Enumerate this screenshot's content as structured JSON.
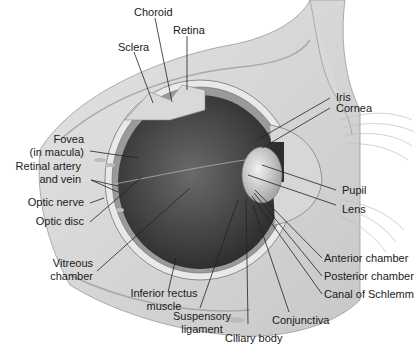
{
  "figure": {
    "labels": {
      "choroid": "Choroid",
      "retina": "Retina",
      "sclera": "Sclera",
      "iris": "Iris",
      "cornea": "Cornea",
      "fovea_l1": "Fovea",
      "fovea_l2": "(in macula)",
      "retinal_l1": "Retinal artery",
      "retinal_l2": "and vein",
      "optic_nerve": "Optic nerve",
      "optic_disc": "Optic disc",
      "pupil": "Pupil",
      "lens": "Lens",
      "vitreous_l1": "Vitreous",
      "vitreous_l2": "chamber",
      "inferior_l1": "Inferior rectus",
      "inferior_l2": "muscle",
      "suspensory_l1": "Suspensory",
      "suspensory_l2": "ligament",
      "ciliary": "Ciliary body",
      "conjunctiva": "Conjunctiva",
      "anterior": "Anterior chamber",
      "posterior": "Posterior chamber",
      "schlemm": "Canal of Schlemm"
    }
  }
}
